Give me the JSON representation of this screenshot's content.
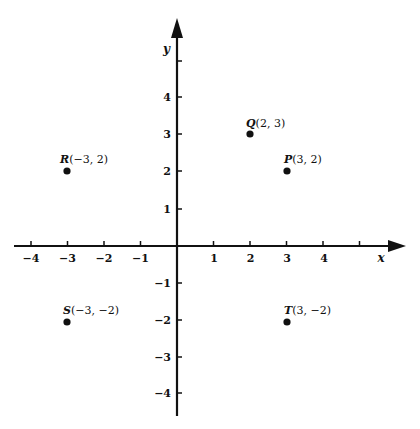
{
  "diagram": {
    "type": "cartesian-coordinate-plane",
    "x_axis": {
      "label": "x",
      "ticks": [
        -4,
        -3,
        -2,
        -1,
        1,
        2,
        3,
        4,
        5
      ],
      "labeled_ticks": [
        -4,
        -3,
        -2,
        -1,
        1,
        2,
        3,
        4
      ]
    },
    "y_axis": {
      "label": "y",
      "ticks": [
        -4,
        -3,
        -2,
        -1,
        1,
        2,
        3,
        4,
        5
      ],
      "labeled_ticks": [
        -4,
        -3,
        -2,
        -1,
        1,
        2,
        3,
        4
      ]
    },
    "tick_text": {
      "x": {
        "m4": "−4",
        "m3": "−3",
        "m2": "−2",
        "m1": "−1",
        "p1": "1",
        "p2": "2",
        "p3": "3",
        "p4": "4"
      },
      "y": {
        "m4": "−4",
        "m3": "−3",
        "m2": "−2",
        "m1": "−1",
        "p1": "1",
        "p2": "2",
        "p3": "3",
        "p4": "4"
      }
    },
    "points": {
      "Q": {
        "letter": "Q",
        "coords": "(2, 3)",
        "x": 2,
        "y": 3
      },
      "R": {
        "letter": "R",
        "coords": "(−3, 2)",
        "x": -3,
        "y": 2
      },
      "P": {
        "letter": "P",
        "coords": "(3, 2)",
        "x": 3,
        "y": 2
      },
      "S": {
        "letter": "S",
        "coords": "(−3, −2)",
        "x": -3,
        "y": -2
      },
      "T": {
        "letter": "T",
        "coords": "(3, −2)",
        "x": 3,
        "y": -2
      }
    },
    "colors": {
      "ink": "#111111",
      "background": "#ffffff"
    }
  }
}
